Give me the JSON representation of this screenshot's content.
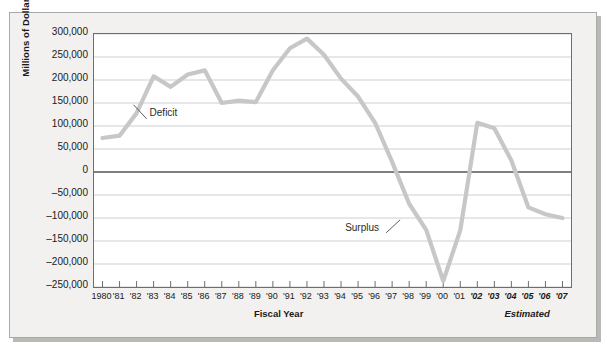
{
  "chart_data": {
    "type": "line",
    "title": "",
    "xlabel": "Fiscal Year",
    "ylabel": "Millions of Dollars",
    "ylim": [
      -250000,
      300000
    ],
    "yticks": [
      300000,
      250000,
      200000,
      150000,
      100000,
      50000,
      0,
      -50000,
      -100000,
      -150000,
      -200000,
      -250000
    ],
    "ytick_labels": [
      "300,000",
      "250,000",
      "200,000",
      "150,000",
      "100,000",
      "50,000",
      "0",
      "-50,000",
      "-100,000",
      "-150,000",
      "-200,000",
      "-250,000"
    ],
    "grid": true,
    "legend": "none",
    "categories": [
      "1980",
      "'81",
      "'82",
      "'83",
      "'84",
      "'85",
      "'86",
      "'87",
      "'88",
      "'89",
      "'90",
      "'91",
      "'92",
      "'93",
      "'94",
      "'95",
      "'96",
      "'97",
      "'98",
      "'99",
      "'00",
      "'01",
      "'02",
      "'03",
      "'04",
      "'05",
      "'06",
      "'07"
    ],
    "values": [
      74000,
      79000,
      128000,
      208000,
      185000,
      212000,
      221000,
      150000,
      155000,
      152000,
      221000,
      269000,
      290000,
      255000,
      203000,
      164000,
      107000,
      22000,
      -69000,
      -126000,
      -237000,
      -127000,
      107000,
      95000,
      25000,
      -77000,
      -92000,
      -100000
    ],
    "series": [
      {
        "name": "Federal budget deficit / surplus",
        "values": [
          74000,
          79000,
          128000,
          208000,
          185000,
          212000,
          221000,
          150000,
          155000,
          152000,
          221000,
          269000,
          290000,
          255000,
          203000,
          164000,
          107000,
          22000,
          -69000,
          -126000,
          -237000,
          -127000,
          107000,
          95000,
          25000,
          -77000,
          -92000,
          -100000
        ]
      }
    ],
    "estimated_from": "'02",
    "estimated_categories": [
      "'02",
      "'03",
      "'04",
      "'05",
      "'06",
      "'07"
    ],
    "annotations": [
      {
        "text": "Deficit",
        "x": "'82",
        "y": 120000
      },
      {
        "text": "Surplus",
        "x": "'97",
        "y": -130000
      }
    ],
    "line_color": "#c7c7c7",
    "zero_line_color": "#555555",
    "grid_color": "#cfcfcf",
    "plot_border_color": "#6e6e6e"
  },
  "axis_captions": {
    "fiscal_year": "Fiscal Year",
    "estimated": "Estimated"
  }
}
